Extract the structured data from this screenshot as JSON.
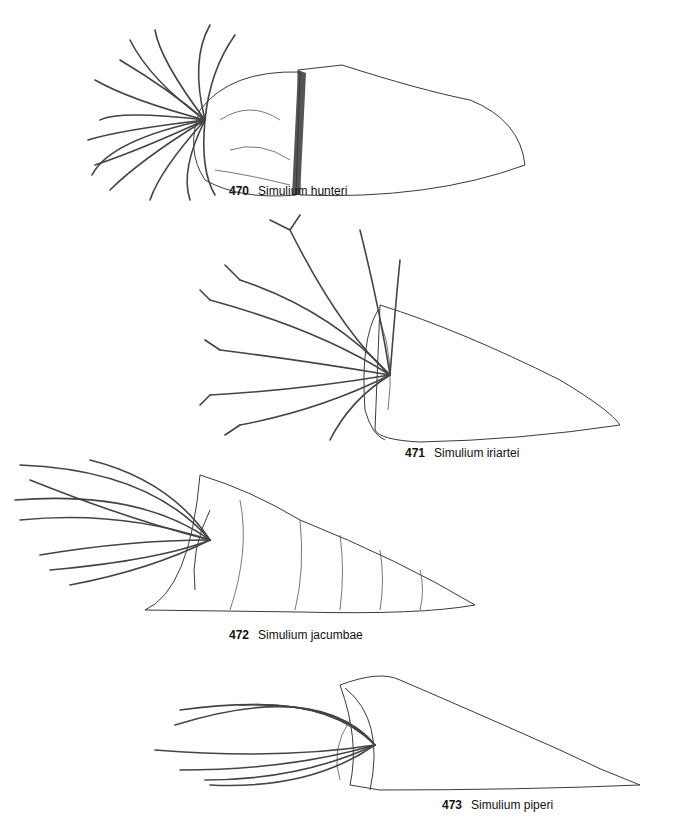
{
  "plate": {
    "figures": [
      {
        "number": "470",
        "species": "Simulium hunteri"
      },
      {
        "number": "471",
        "species": "Simulium iriartei"
      },
      {
        "number": "472",
        "species": "Simulium jacumbae"
      },
      {
        "number": "473",
        "species": "Simulium piperi"
      }
    ]
  }
}
